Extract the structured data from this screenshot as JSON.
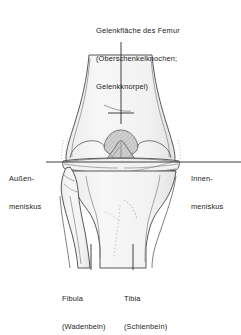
{
  "figure": {
    "background_color": "#ffffff",
    "line_color": "#3a3a3a",
    "fill_color": "#f4f4f4",
    "text_color": "#1b1b1b",
    "shade_color": "#9a9a9a"
  },
  "labels": {
    "femur": {
      "line1": "Gelenkfläche des Femur",
      "line2": "(Oberschenkelknochen;",
      "line3": "Gelenkknorpel)"
    },
    "lateral_meniscus": {
      "line1": "Außen-",
      "line2": "meniskus"
    },
    "medial_meniscus": {
      "line1": "Innen-",
      "line2": "meniskus"
    },
    "fibula": {
      "line1": "Fibula",
      "line2": "(Wadenbein)"
    },
    "tibia": {
      "line1": "Tibia",
      "line2": "(Schienbein)"
    }
  }
}
